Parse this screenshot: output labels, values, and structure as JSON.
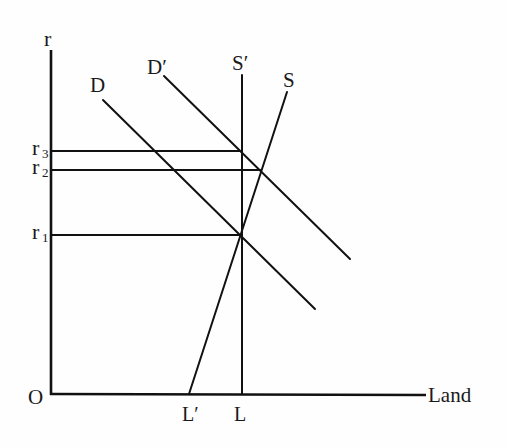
{
  "diagram": {
    "type": "economics-supply-demand",
    "axes": {
      "y_label": "r",
      "x_label": "Land",
      "origin_label": "O",
      "y_ticks": [
        {
          "label": "r",
          "sub": "3",
          "y": 151
        },
        {
          "label": "r",
          "sub": "2",
          "y": 170
        },
        {
          "label": "r",
          "sub": "1",
          "y": 235
        }
      ],
      "x_ticks": [
        {
          "label": "L′",
          "x": 189
        },
        {
          "label": "L",
          "x": 241
        }
      ]
    },
    "curves": [
      {
        "name": "D",
        "label": "D",
        "from": [
          103,
          100
        ],
        "to": [
          315,
          309
        ]
      },
      {
        "name": "D-prime",
        "label": "D′",
        "from": [
          164,
          76
        ],
        "to": [
          350,
          259
        ]
      },
      {
        "name": "S-prime",
        "label": "S′",
        "from": [
          242,
          75
        ],
        "to": [
          242,
          394
        ]
      },
      {
        "name": "S",
        "label": "S",
        "from": [
          287,
          92
        ],
        "to": [
          189,
          394
        ]
      }
    ]
  },
  "labels": {
    "r": "r",
    "land": "Land",
    "origin": "O",
    "D": "D",
    "D_prime": "D′",
    "S_prime": "S′",
    "S": "S",
    "r3": "r",
    "r3_sub": "3",
    "r2": "r",
    "r2_sub": "2",
    "r1": "r",
    "r1_sub": "1",
    "L_prime": "L′",
    "L": "L"
  }
}
